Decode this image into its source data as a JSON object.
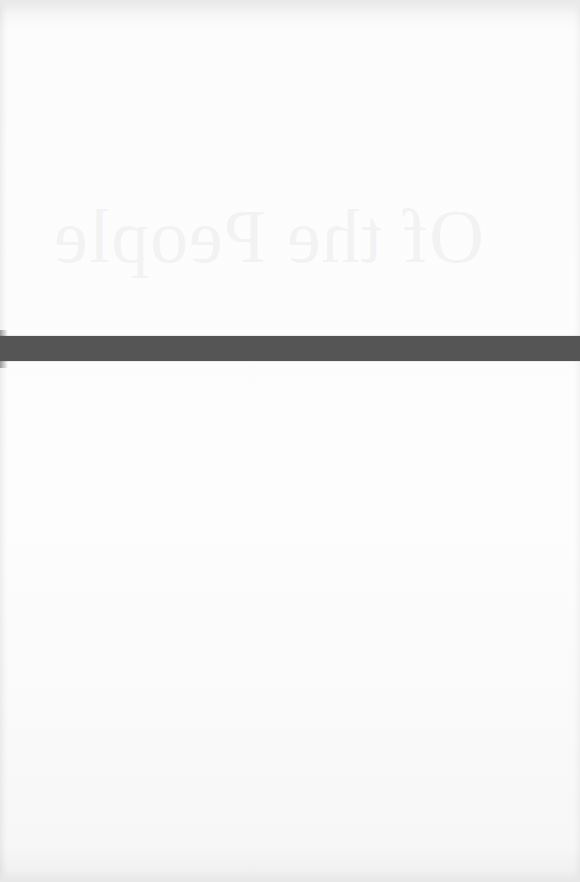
{
  "page": {
    "type": "book cover interior (blank page)",
    "background_color": "#fcfcfc"
  },
  "show_through": {
    "title_mirrored": "Of the People",
    "color": "#969696"
  },
  "band": {
    "color": "#555555"
  }
}
